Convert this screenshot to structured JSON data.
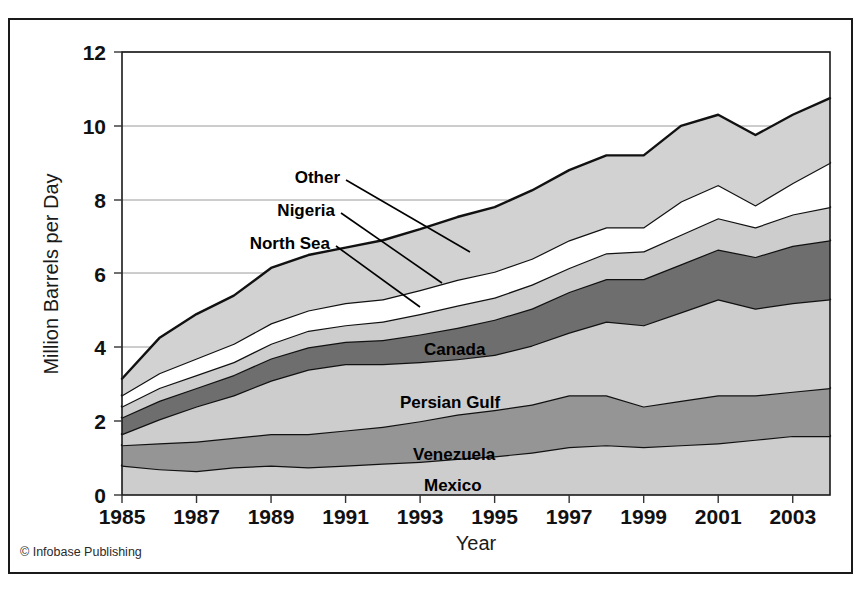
{
  "figure": {
    "credit": "© Infobase Publishing"
  },
  "chart_data": {
    "type": "area",
    "stacked": true,
    "title": "",
    "xlabel": "Year",
    "ylabel": "Million Barrels per Day",
    "xlim": [
      1985,
      2004
    ],
    "ylim": [
      0,
      12
    ],
    "yticks": [
      0,
      2,
      4,
      6,
      8,
      10,
      12
    ],
    "ytick_labels": [
      "0",
      "2",
      "4",
      "6",
      "8",
      "10",
      "12"
    ],
    "xticks": [
      1985,
      1987,
      1989,
      1991,
      1993,
      1995,
      1997,
      1999,
      2001,
      2003
    ],
    "xtick_labels": [
      "1985",
      "1987",
      "1989",
      "1991",
      "1993",
      "1995",
      "1997",
      "1999",
      "2001",
      "2003"
    ],
    "grid": "horizontal",
    "legend_position": "inline-annotations",
    "x": [
      1985,
      1986,
      1987,
      1988,
      1989,
      1990,
      1991,
      1992,
      1993,
      1994,
      1995,
      1996,
      1997,
      1998,
      1999,
      2000,
      2001,
      2002,
      2003,
      2004
    ],
    "series": [
      {
        "name": "Mexico",
        "fill": "#cdcdcd",
        "label_position": "inline",
        "values": [
          0.8,
          0.7,
          0.65,
          0.75,
          0.8,
          0.75,
          0.8,
          0.85,
          0.9,
          0.98,
          1.05,
          1.15,
          1.3,
          1.35,
          1.3,
          1.35,
          1.4,
          1.5,
          1.6,
          1.6
        ]
      },
      {
        "name": "Venezuela",
        "fill": "#959595",
        "label_position": "inline",
        "values": [
          0.55,
          0.7,
          0.8,
          0.8,
          0.85,
          0.9,
          0.95,
          1.0,
          1.1,
          1.2,
          1.25,
          1.3,
          1.4,
          1.35,
          1.1,
          1.2,
          1.3,
          1.2,
          1.2,
          1.3
        ]
      },
      {
        "name": "Persian Gulf",
        "fill": "#cdcdcd",
        "label_position": "inline",
        "values": [
          0.3,
          0.65,
          0.95,
          1.15,
          1.45,
          1.75,
          1.8,
          1.7,
          1.6,
          1.5,
          1.5,
          1.6,
          1.7,
          2.0,
          2.2,
          2.4,
          2.6,
          2.35,
          2.4,
          2.4
        ]
      },
      {
        "name": "Canada",
        "fill": "#6e6e6e",
        "label_position": "inline",
        "values": [
          0.45,
          0.5,
          0.5,
          0.55,
          0.6,
          0.6,
          0.6,
          0.65,
          0.75,
          0.85,
          0.95,
          1.0,
          1.1,
          1.15,
          1.25,
          1.3,
          1.35,
          1.4,
          1.55,
          1.6
        ]
      },
      {
        "name": "North Sea",
        "fill": "#cdcdcd",
        "label_position": "leader",
        "values": [
          0.3,
          0.35,
          0.35,
          0.35,
          0.4,
          0.45,
          0.45,
          0.5,
          0.55,
          0.6,
          0.6,
          0.65,
          0.65,
          0.7,
          0.75,
          0.8,
          0.85,
          0.8,
          0.85,
          0.9
        ]
      },
      {
        "name": "Nigeria",
        "fill": "#ffffff",
        "label_position": "leader",
        "values": [
          0.3,
          0.4,
          0.45,
          0.5,
          0.55,
          0.55,
          0.6,
          0.6,
          0.65,
          0.7,
          0.7,
          0.7,
          0.75,
          0.7,
          0.65,
          0.9,
          0.9,
          0.6,
          0.85,
          1.2
        ]
      },
      {
        "name": "Other",
        "fill": "#d2d2d2",
        "label_position": "leader",
        "values": [
          0.45,
          0.95,
          1.2,
          1.3,
          1.5,
          1.5,
          1.5,
          1.6,
          1.65,
          1.7,
          1.75,
          1.85,
          1.9,
          1.95,
          1.95,
          2.05,
          1.9,
          1.9,
          1.85,
          1.75
        ]
      }
    ],
    "totals": [
      3.15,
      4.25,
      4.9,
      5.4,
      6.15,
      6.5,
      6.7,
      6.9,
      7.2,
      7.53,
      7.8,
      8.25,
      8.8,
      9.2,
      9.2,
      10.0,
      10.3,
      9.75,
      10.3,
      10.75
    ],
    "annotations": [
      {
        "text": "Other",
        "x": 340,
        "y": 177,
        "leader_to_x": 470,
        "leader_to_y": 250
      },
      {
        "text": "Nigeria",
        "x": 325,
        "y": 212,
        "leader_to_x": 445,
        "leader_to_y": 281
      },
      {
        "text": "North Sea",
        "x": 310,
        "y": 245,
        "leader_to_x": 425,
        "leader_to_y": 305
      }
    ]
  }
}
